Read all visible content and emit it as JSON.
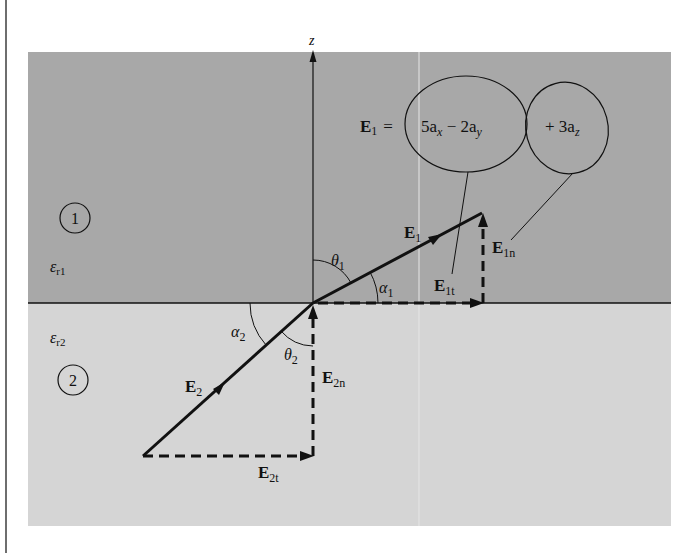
{
  "diagram": {
    "type": "vector-boundary-conditions",
    "colors": {
      "region1": "#a8a8a8",
      "region2": "#d5d5d5",
      "stroke": "#111111",
      "page_bar": "#6e6e6e",
      "seam": "#e6e6e6"
    },
    "axis": {
      "label": "z"
    },
    "regions": [
      {
        "id": "1",
        "label": "1",
        "permittivity": {
          "symbol": "ε",
          "sub": "r1"
        }
      },
      {
        "id": "2",
        "label": "2",
        "permittivity": {
          "symbol": "ε",
          "sub": "r2"
        }
      }
    ],
    "equation": {
      "lhs": "E",
      "lhs_sub": "1",
      "equals": "=",
      "group1": {
        "t1": "5a",
        "t1_sub": "x",
        "op": " − 2a",
        "t2_sub": "y"
      },
      "group2": {
        "t": "+ 3a",
        "t_sub": "z"
      }
    },
    "vectors": {
      "E1": {
        "main": "E",
        "sub": "1"
      },
      "E1t": {
        "main": "E",
        "sub": "1t"
      },
      "E1n": {
        "main": "E",
        "sub": "1n"
      },
      "E2": {
        "main": "E",
        "sub": "2"
      },
      "E2t": {
        "main": "E",
        "sub": "2t"
      },
      "E2n": {
        "main": "E",
        "sub": "2n"
      }
    },
    "angles": {
      "theta1": {
        "sym": "θ",
        "sub": "1"
      },
      "alpha1": {
        "sym": "α",
        "sub": "1"
      },
      "theta2": {
        "sym": "θ",
        "sub": "2"
      },
      "alpha2": {
        "sym": "α",
        "sub": "2"
      }
    }
  }
}
